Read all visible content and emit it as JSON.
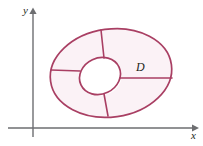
{
  "figure": {
    "background_color": "#ffffff"
  },
  "axes": {
    "color": "#6d6e71",
    "x_axis": {
      "label": "x",
      "name": "x-axis",
      "start_x": 8,
      "end_x": 195,
      "y": 128,
      "arrow": "right"
    },
    "y_axis": {
      "label": "y",
      "name": "y-axis",
      "x": 33,
      "start_y": 137,
      "end_y": 10,
      "arrow": "up"
    }
  },
  "region": {
    "label": "D",
    "label_x": 141,
    "label_y": 68,
    "stroke_color": "#a93f63",
    "fill_color": "#fbf2f6",
    "hole_fill_color": "#ffffff",
    "stroke_width": 1.6,
    "outer_boundary": {
      "name": "outer-oval",
      "center_x": 111,
      "center_y": 73,
      "radius_x": 61,
      "radius_y": 44,
      "rotation_deg": -8
    },
    "inner_boundary": {
      "name": "inner-hole-oval",
      "center_x": 100,
      "center_y": 76,
      "radius_x": 21,
      "radius_y": 18,
      "rotation_deg": -25
    },
    "dividing_spokes": [
      {
        "name": "spoke-top",
        "x1": 101,
        "y1": 30,
        "x2": 104,
        "y2": 58
      },
      {
        "name": "spoke-left",
        "x1": 51,
        "y1": 70,
        "x2": 80,
        "y2": 71
      },
      {
        "name": "spoke-right",
        "x1": 120,
        "y1": 78,
        "x2": 172,
        "y2": 78
      },
      {
        "name": "spoke-bottom",
        "x1": 108,
        "y1": 116,
        "x2": 104,
        "y2": 94
      }
    ],
    "subregion_count": 4
  }
}
